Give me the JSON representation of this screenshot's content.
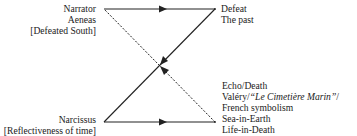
{
  "diagram": {
    "top_left": {
      "lines": [
        "Narrator",
        "Aeneas",
        "[Defeated South]"
      ]
    },
    "top_right": {
      "lines": [
        "Defeat",
        "The past"
      ]
    },
    "bottom_left": {
      "lines": [
        "Narcissus",
        "[Reflectiveness of time]"
      ]
    },
    "bottom_right": {
      "line1": "Echo/Death",
      "line2_prefix": "Valéry/",
      "line2_italic": "“Le Cimetière Marin”",
      "line2_suffix": "/",
      "line3": "French symbolism",
      "line4": "Sea-in-Earth",
      "line5": "Life-in-Death"
    },
    "edges": [
      {
        "from": "Narrator",
        "to": "Defeat",
        "style": "solid",
        "arrow": "right"
      },
      {
        "from": "Defeat",
        "to": "Narcissus",
        "style": "solid",
        "arrow": "down-left"
      },
      {
        "from": "Echo/Death",
        "to": "Narrator",
        "style": "dashed",
        "arrow": "up-left"
      },
      {
        "from": "Narcissus",
        "to": "Echo/Death",
        "style": "solid",
        "arrow": "right"
      }
    ],
    "colors": {
      "line": "#222222",
      "text": "#222222",
      "background": "#ffffff"
    }
  }
}
